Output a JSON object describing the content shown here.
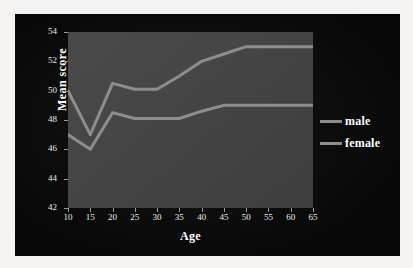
{
  "chart_data": {
    "type": "line",
    "title": "",
    "xlabel": "Age",
    "ylabel": "Mean score",
    "x": [
      10,
      15,
      20,
      25,
      30,
      35,
      40,
      45,
      50,
      55,
      60,
      65
    ],
    "xtick_labels": [
      "10",
      "15",
      "20",
      "25",
      "30",
      "35",
      "40",
      "45",
      "50",
      "55",
      "60",
      "65"
    ],
    "ytick_labels": [
      "42",
      "44",
      "46",
      "48",
      "50",
      "52",
      "54"
    ],
    "ytick_values": [
      42,
      44,
      46,
      48,
      50,
      52,
      54
    ],
    "xlim": [
      10,
      65
    ],
    "ylim": [
      42,
      54
    ],
    "grid": false,
    "legend_position": "right",
    "series": [
      {
        "name": "male",
        "color": "#8d8d8d",
        "values": [
          50.0,
          47.0,
          50.5,
          50.1,
          50.1,
          51.0,
          52.0,
          52.5,
          53.0,
          53.0,
          53.0,
          53.0
        ]
      },
      {
        "name": "female",
        "color": "#8d8d8d",
        "values": [
          47.0,
          46.0,
          48.5,
          48.1,
          48.1,
          48.1,
          48.6,
          49.0,
          49.0,
          49.0,
          49.0,
          49.0
        ]
      }
    ]
  },
  "legend": {
    "items": [
      {
        "label": "male"
      },
      {
        "label": "female"
      }
    ]
  },
  "colors": {
    "page_background": "#f4f3f1",
    "panel_background": "#0a0a0a",
    "plot_background": "#434343",
    "line": "#8d8d8d",
    "text": "#ffffff"
  }
}
